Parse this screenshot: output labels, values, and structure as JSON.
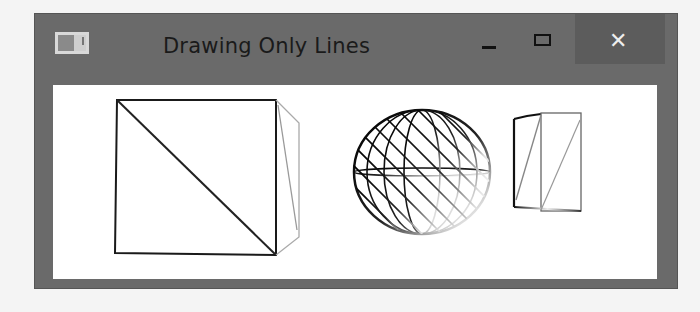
{
  "window": {
    "title": "Drawing Only Lines",
    "app_icon": "window-app-icon",
    "controls": {
      "minimize_icon": "minimize-icon",
      "maximize_icon": "maximize-icon",
      "close_icon": "close-icon",
      "close_glyph": "✕"
    }
  },
  "scene": {
    "description": "Wireframe rendering: cube, sphere, and small prism drawn with lines only",
    "objects": [
      "cube",
      "sphere",
      "prism"
    ],
    "colors": {
      "line_dark": "#111111",
      "line_fade": "#ffffff",
      "background": "#ffffff",
      "frame": "#6a6a6a"
    }
  }
}
